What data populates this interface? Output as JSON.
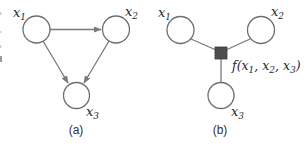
{
  "figure": {
    "panels": [
      {
        "id": "a",
        "caption": "(a)",
        "type": "directed-graph",
        "nodes": [
          {
            "id": "x1",
            "label": "x",
            "sub": "1"
          },
          {
            "id": "x2",
            "label": "x",
            "sub": "2"
          },
          {
            "id": "x3",
            "label": "x",
            "sub": "3"
          }
        ],
        "edges": [
          {
            "from": "x1",
            "to": "x2",
            "directed": true
          },
          {
            "from": "x1",
            "to": "x3",
            "directed": true
          },
          {
            "from": "x2",
            "to": "x3",
            "directed": true
          }
        ]
      },
      {
        "id": "b",
        "caption": "(b)",
        "type": "factor-graph",
        "nodes": [
          {
            "id": "x1",
            "label": "x",
            "sub": "1"
          },
          {
            "id": "x2",
            "label": "x",
            "sub": "2"
          },
          {
            "id": "x3",
            "label": "x",
            "sub": "3"
          }
        ],
        "factor": {
          "id": "f",
          "label_prefix": "f(",
          "args": [
            {
              "label": "x",
              "sub": "1"
            },
            {
              "label": "x",
              "sub": "2"
            },
            {
              "label": "x",
              "sub": "3"
            }
          ],
          "separator": ", ",
          "label_suffix": ")"
        },
        "edges": [
          {
            "from": "x1",
            "to": "f",
            "directed": false
          },
          {
            "from": "x2",
            "to": "f",
            "directed": false
          },
          {
            "from": "x3",
            "to": "f",
            "directed": false
          }
        ]
      }
    ],
    "colors": {
      "node_stroke": "#6e6e6e",
      "edge": "#7a7a7a",
      "factor_fill": "#4d4d4d",
      "text": "#2a2a2a"
    }
  }
}
